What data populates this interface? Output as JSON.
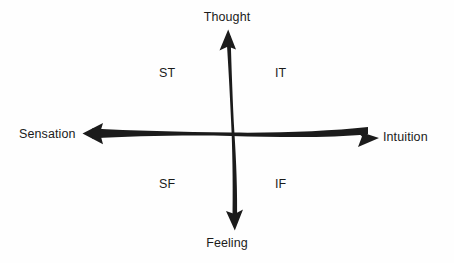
{
  "diagram": {
    "ink_color": "#1b1b1b",
    "background_color": "#fefefe",
    "vertical_axis": {
      "top_label": "Thought",
      "bottom_label": "Feeling"
    },
    "horizontal_axis": {
      "left_label": "Sensation",
      "right_label": "Intuition"
    },
    "quadrants": [
      {
        "code": "ST",
        "position": "upper-left"
      },
      {
        "code": "IT",
        "position": "upper-right"
      },
      {
        "code": "SF",
        "position": "lower-left"
      },
      {
        "code": "IF",
        "position": "lower-right"
      }
    ]
  }
}
